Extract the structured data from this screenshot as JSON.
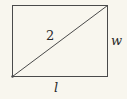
{
  "diagram": {
    "shape": "rectangle",
    "diagonal_label": "2",
    "width_label": "w",
    "length_label": "l",
    "colors": {
      "background": "#f8f6ee",
      "stroke": "#4a4a4a",
      "text": "#2a2a2a"
    }
  }
}
